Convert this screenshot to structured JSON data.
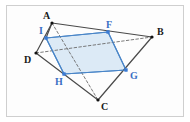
{
  "figure": {
    "type": "geometry-diagram",
    "background_color": "#fdfdfd",
    "border_color": "#cfcfcf",
    "solid_edge_color": "#4a4a4a",
    "dashed_edge_color": "#6b6b6b",
    "cross_section_fill": "#cfe2f3",
    "cross_section_stroke": "#4a86c8",
    "vertex_dot_color": "#111111",
    "cross_vertex_dot_color": "#3a7bd5",
    "label_color": "#1a1a1a",
    "cross_label_color": "#3a6fc4"
  },
  "chart_data": {
    "type": "scatter",
    "title": "",
    "xlabel": "",
    "ylabel": "",
    "grid": false,
    "legend": "none",
    "points": [
      {
        "name": "A",
        "x": 52,
        "y": 23,
        "label": "A",
        "label_dx": -9,
        "label_dy": -12,
        "color": "#111111",
        "group": "tetrahedron"
      },
      {
        "name": "B",
        "x": 152,
        "y": 37,
        "label": "B",
        "label_dx": 5,
        "label_dy": -10,
        "color": "#111111",
        "group": "tetrahedron"
      },
      {
        "name": "C",
        "x": 98,
        "y": 100,
        "label": "C",
        "label_dx": 3,
        "label_dy": 2,
        "color": "#111111",
        "group": "tetrahedron"
      },
      {
        "name": "D",
        "x": 36,
        "y": 53,
        "label": "D",
        "label_dx": -12,
        "label_dy": 2,
        "color": "#111111",
        "group": "tetrahedron"
      },
      {
        "name": "I",
        "x": 46,
        "y": 38,
        "label": "I",
        "label_dx": -7,
        "label_dy": -12,
        "color": "#3a7bd5",
        "group": "cross-section"
      },
      {
        "name": "F",
        "x": 108,
        "y": 32,
        "label": "F",
        "label_dx": -2,
        "label_dy": -12,
        "color": "#3a7bd5",
        "group": "cross-section"
      },
      {
        "name": "G",
        "x": 126,
        "y": 70,
        "label": "G",
        "label_dx": 4,
        "label_dy": 1,
        "color": "#3a7bd5",
        "group": "cross-section"
      },
      {
        "name": "H",
        "x": 64,
        "y": 74,
        "label": "H",
        "label_dx": -9,
        "label_dy": 3,
        "color": "#3a7bd5",
        "group": "cross-section"
      }
    ],
    "edges": [
      {
        "name": "AB",
        "from": "A",
        "to": "B",
        "style": "solid",
        "color": "#4a4a4a"
      },
      {
        "name": "AD",
        "from": "A",
        "to": "D",
        "style": "solid",
        "color": "#4a4a4a"
      },
      {
        "name": "DC",
        "from": "D",
        "to": "C",
        "style": "solid",
        "color": "#4a4a4a"
      },
      {
        "name": "BC",
        "from": "B",
        "to": "C",
        "style": "solid",
        "color": "#4a4a4a"
      },
      {
        "name": "DB",
        "from": "D",
        "to": "B",
        "style": "dashed",
        "color": "#6b6b6b"
      },
      {
        "name": "AC",
        "from": "A",
        "to": "C",
        "style": "dashed",
        "color": "#6b6b6b"
      }
    ],
    "polygons": [
      {
        "name": "cross-section-IFGH",
        "vertices": [
          "I",
          "F",
          "G",
          "H"
        ],
        "fill": "#cfe2f3",
        "fill_opacity": 0.72,
        "stroke": "#4a86c8"
      }
    ]
  },
  "labels": {
    "A": "A",
    "B": "B",
    "C": "C",
    "D": "D",
    "I": "I",
    "F": "F",
    "G": "G",
    "H": "H"
  }
}
